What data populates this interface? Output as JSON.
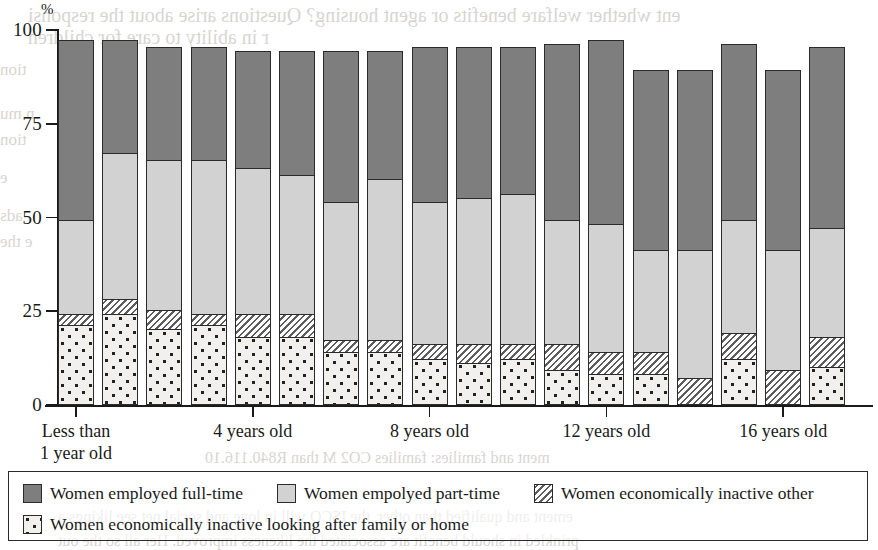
{
  "chart_data": {
    "type": "bar",
    "subtype": "stacked-bar-100",
    "title": "",
    "xlabel": "",
    "ylabel": "%",
    "ylim": [
      0,
      100
    ],
    "yticks": [
      0,
      25,
      50,
      75,
      100
    ],
    "ytick_labels": [
      "0",
      "25",
      "50",
      "75",
      "100"
    ],
    "grid": false,
    "legend_position": "bottom",
    "bar_count": 18,
    "categories": [
      "Less than 1 year old",
      "1 year old",
      "2 years old",
      "3 years old",
      "4 years old",
      "5 years old",
      "6 years old",
      "7 years old",
      "8 years old",
      "9 years old",
      "10 years old",
      "11 years old",
      "12 years old",
      "13 years old",
      "14 years old",
      "15 years old",
      "16 years old",
      "17 years old"
    ],
    "xtick_labels": [
      {
        "text": "Less than\n1 year old",
        "bar_index": 0
      },
      {
        "text": "4 years old",
        "bar_index": 4
      },
      {
        "text": "8 years old",
        "bar_index": 8
      },
      {
        "text": "12 years old",
        "bar_index": 12
      },
      {
        "text": "16 years old",
        "bar_index": 16
      }
    ],
    "series": [
      {
        "name": "Women economically inactive looking after family or home",
        "key": "family",
        "pattern": "dots",
        "color": "#f1f0ed",
        "values": [
          21,
          24,
          20,
          21,
          18,
          18,
          14,
          14,
          12,
          11,
          12,
          9,
          8,
          8,
          0,
          12,
          0,
          10
        ]
      },
      {
        "name": "Women economically inactive other",
        "key": "other",
        "pattern": "diagonal-hatch",
        "color": "#ffffff",
        "values": [
          3,
          4,
          5,
          3,
          6,
          6,
          3,
          3,
          4,
          5,
          4,
          7,
          6,
          6,
          7,
          7,
          9,
          8
        ]
      },
      {
        "name": "Women empolyed part-time",
        "key": "part",
        "pattern": "solid",
        "color": "#d2d2d2",
        "values": [
          25,
          39,
          40,
          41,
          39,
          37,
          37,
          43,
          38,
          39,
          40,
          33,
          34,
          27,
          34,
          30,
          32,
          29
        ]
      },
      {
        "name": "Women employed full-time",
        "key": "full",
        "pattern": "solid",
        "color": "#7e7e7e",
        "values": [
          48,
          30,
          30,
          30,
          31,
          33,
          40,
          34,
          41,
          40,
          39,
          47,
          49,
          48,
          48,
          47,
          48,
          48
        ]
      }
    ],
    "bar_totals": [
      97,
      97,
      95,
      95,
      94,
      94,
      94,
      94,
      95,
      95,
      95,
      96,
      97,
      89,
      89,
      96,
      89,
      95
    ]
  },
  "axis": {
    "percent_symbol": "%"
  },
  "legend": {
    "items": [
      {
        "label": "Women employed full-time",
        "swatch": "solid-dark-gray"
      },
      {
        "label": "Women empolyed part-time",
        "swatch": "solid-light-gray"
      },
      {
        "label": "Women economically inactive other",
        "swatch": "diagonal-hatch"
      },
      {
        "label": "Women economically inactive looking after family or home",
        "swatch": "dotted"
      }
    ]
  },
  "background_text": {
    "lines": [
      {
        "text": "ent whether welfare benefits or agent housing? Questions arise about the responsi",
        "x": 28,
        "y": 4,
        "size": 20
      },
      {
        "text": "r in ability to care for children",
        "x": 28,
        "y": 26,
        "size": 20
      },
      {
        "text": "tion",
        "x": 0,
        "y": 60,
        "size": 17
      },
      {
        "text": "n mu",
        "x": 0,
        "y": 104,
        "size": 17
      },
      {
        "text": "tion",
        "x": 0,
        "y": 130,
        "size": 17
      },
      {
        "text": "e",
        "x": 0,
        "y": 168,
        "size": 17
      },
      {
        "text": "ads",
        "x": 0,
        "y": 206,
        "size": 17
      },
      {
        "text": "e the",
        "x": 0,
        "y": 232,
        "size": 17
      },
      {
        "text": "ment and families: families CO2 M than R840.116.10",
        "x": 205,
        "y": 449,
        "size": 16
      },
      {
        "text": "ement and qualified than other, the ISCO will in lone and social net see likings a",
        "x": 58,
        "y": 508,
        "size": 16
      },
      {
        "text": "prinkled in should benefit are associated the likeness improved. Her all so the out",
        "x": 58,
        "y": 532,
        "size": 16
      }
    ]
  }
}
